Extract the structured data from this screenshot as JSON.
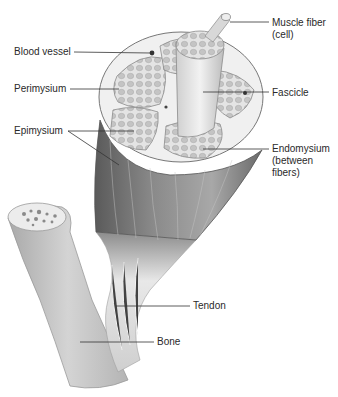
{
  "figure": {
    "labels": {
      "blood_vessel": "Blood vessel",
      "perimysium": "Perimysium",
      "epimysium": "Epimysium",
      "muscle_fiber": "Muscle fiber\n(cell)",
      "fascicle": "Fascicle",
      "endomysium": "Endomysium\n(between\nfibers)",
      "tendon": "Tendon",
      "bone": "Bone"
    },
    "colors": {
      "line": "#333333",
      "muscle_dark": "#6e6e6e",
      "muscle_mid": "#9a9a9a",
      "bone": "#c9c9c9",
      "tendon": "#e6e6e6",
      "fascicle_fill": "#d8d8d8"
    }
  }
}
